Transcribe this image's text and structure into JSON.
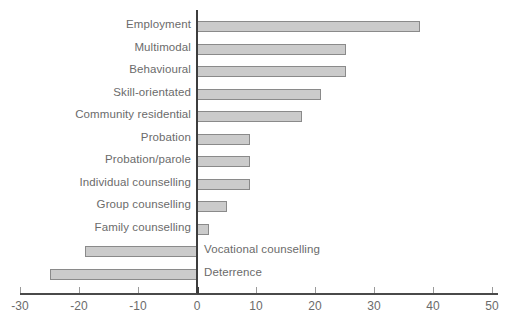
{
  "chart_data": {
    "type": "bar",
    "orientation": "horizontal",
    "title": "",
    "xlabel": "",
    "ylabel": "",
    "xlim": [
      -30,
      50
    ],
    "xticks": [
      -30,
      -20,
      -10,
      0,
      10,
      20,
      30,
      40,
      50
    ],
    "xtick_labels": [
      "-30",
      "-20",
      "-10",
      "0",
      "10",
      "20",
      "30",
      "40",
      "50"
    ],
    "grid": false,
    "legend": false,
    "bar_color": "#cbcbcb",
    "bar_border_color": "#8a8a8a",
    "axis_color": "#3d3d3d",
    "label_color": "#6b6b6b",
    "categories": [
      "Employment",
      "Multimodal",
      "Behavioural",
      "Skill-orientated",
      "Community residential",
      "Probation",
      "Probation/parole",
      "Individual counselling",
      "Group counselling",
      "Family counselling",
      "Vocational counselling",
      "Deterrence"
    ],
    "values": [
      37.8,
      25.3,
      25.3,
      21.0,
      17.8,
      9.0,
      9.0,
      9.0,
      5.0,
      2.0,
      -19.0,
      -25.0
    ]
  }
}
